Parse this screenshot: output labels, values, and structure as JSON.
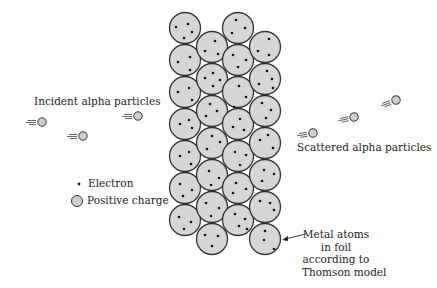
{
  "diagram": {
    "labels": {
      "incident": "Incident alpha particles",
      "scattered": "Scattered alpha particles",
      "electron": "Electron",
      "positive_charge": "Positive charge",
      "metal_atoms_lines": [
        "Metal atoms",
        "in foil",
        "according to",
        "Thomson model"
      ]
    },
    "colors": {
      "atom_fill": "#d6d6d6",
      "atom_stroke": "#333333",
      "electron": "#111111",
      "text": "#222222"
    },
    "legend": [
      {
        "icon": "electron-dot-icon",
        "label": "Electron"
      },
      {
        "icon": "positive-charge-circle-icon",
        "label": "Positive charge"
      }
    ],
    "incident_particles": [
      {
        "x": 42,
        "y": 122
      },
      {
        "x": 138,
        "y": 116
      },
      {
        "x": 83,
        "y": 136
      }
    ],
    "scattered_particles": [
      {
        "x": 313,
        "y": 133
      },
      {
        "x": 354,
        "y": 117
      },
      {
        "x": 396,
        "y": 100
      }
    ]
  }
}
